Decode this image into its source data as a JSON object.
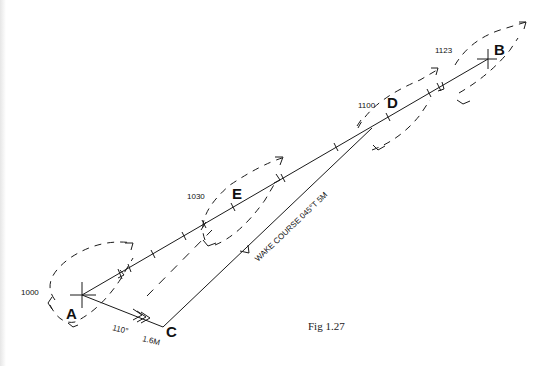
{
  "figure": {
    "caption": "Fig 1.27"
  },
  "points": {
    "A": {
      "label": "A",
      "time": "1000"
    },
    "B": {
      "label": "B",
      "time": "1123"
    },
    "C": {
      "label": "C"
    },
    "D": {
      "label": "D",
      "time": "1100"
    },
    "E": {
      "label": "E",
      "time": "1030"
    }
  },
  "vectors": {
    "tide_bearing": "110°",
    "tide_distance": "1.6M",
    "wake_course": "WAKE COURSE 045°T 5M"
  },
  "colors": {
    "ink": "#1a1a1a",
    "background": "#ffffff"
  }
}
